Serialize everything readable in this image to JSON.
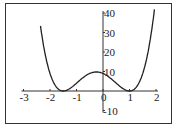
{
  "chart_data": {
    "type": "line",
    "title": "",
    "xlabel": "",
    "ylabel": "",
    "function": "f(x) = 4(x+1.5)^2 (x-1)^2",
    "xlim": [
      -3,
      2
    ],
    "ylim": [
      -10,
      40
    ],
    "x_ticks": [
      "-3",
      "-2",
      "-1",
      "0",
      "1",
      "2"
    ],
    "y_ticks": [
      "40",
      "30",
      "20",
      "10",
      "-10"
    ],
    "grid": false,
    "legend": null,
    "series": [
      {
        "name": "curve",
        "x": [
          -2.35,
          -2.25,
          -2.0,
          -1.75,
          -1.5,
          -1.25,
          -1.0,
          -0.75,
          -0.5,
          -0.25,
          0.0,
          0.25,
          0.5,
          0.75,
          1.0,
          1.25,
          1.5,
          1.75,
          1.95
        ],
        "y": [
          38.4,
          28.1,
          9.0,
          1.9,
          0.0,
          1.3,
          4.0,
          6.9,
          9.0,
          9.8,
          9.0,
          6.9,
          4.0,
          1.3,
          0.0,
          1.9,
          9.0,
          24.0,
          43.0
        ]
      }
    ]
  },
  "colors": {
    "curve": "#222222",
    "axis": "#333333",
    "frame": "#333333",
    "background": "#ffffff"
  }
}
